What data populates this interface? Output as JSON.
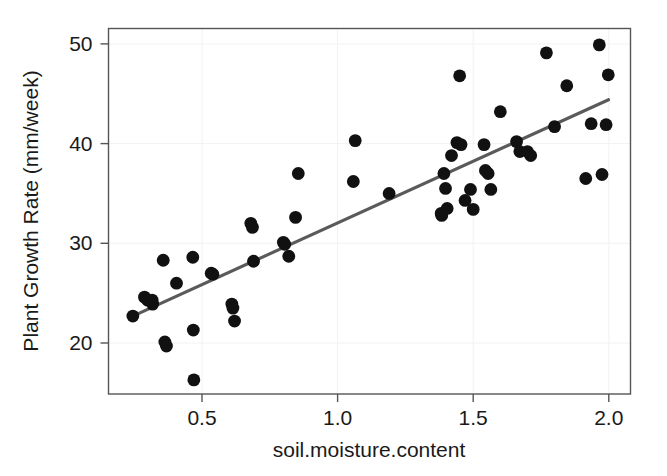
{
  "chart_data": {
    "type": "scatter",
    "title": "",
    "xlabel": "soil.moisture.content",
    "ylabel": "Plant Growth Rate (mm/week)",
    "xlim": [
      0.21,
      2.08
    ],
    "ylim": [
      15.0,
      51.3
    ],
    "xticks": [
      0.5,
      1.0,
      1.5,
      2.0
    ],
    "xtick_labels": [
      "0.5",
      "1.0",
      "1.5",
      "2.0"
    ],
    "yticks": [
      20,
      30,
      40,
      50
    ],
    "ytick_labels": [
      "20",
      "30",
      "40",
      "50"
    ],
    "grid": true,
    "grid_color": "#f2f2f2",
    "legend": null,
    "point_color": "#111111",
    "point_size": 6.4,
    "fitline": {
      "name": "linear regression fit",
      "color": "#5a5a5a",
      "width": 3.1,
      "x": [
        0.245,
        1.999
      ],
      "y": [
        22.7,
        44.4
      ]
    },
    "x": [
      0.245,
      0.288,
      0.3,
      0.316,
      0.318,
      0.357,
      0.363,
      0.369,
      0.406,
      0.466,
      0.468,
      0.47,
      0.534,
      0.54,
      0.61,
      0.614,
      0.62,
      0.68,
      0.686,
      0.69,
      0.8,
      0.805,
      0.82,
      0.845,
      0.855,
      1.058,
      1.065,
      1.19,
      1.382,
      1.384,
      1.392,
      1.398,
      1.404,
      1.42,
      1.44,
      1.45,
      1.455,
      1.47,
      1.49,
      1.5,
      1.54,
      1.545,
      1.555,
      1.565,
      1.6,
      1.66,
      1.672,
      1.7,
      1.712,
      1.77,
      1.8,
      1.845,
      1.915,
      1.935,
      1.965,
      1.975,
      1.99,
      1.998
    ],
    "y": [
      22.7,
      24.6,
      24.3,
      24.3,
      23.9,
      28.3,
      20.1,
      19.7,
      26.0,
      28.6,
      21.3,
      16.3,
      27.0,
      26.9,
      23.9,
      23.5,
      22.2,
      32.0,
      31.6,
      28.2,
      30.1,
      29.9,
      28.7,
      32.6,
      37.0,
      36.2,
      40.3,
      35.0,
      33.0,
      32.8,
      37.0,
      35.5,
      33.5,
      38.8,
      40.1,
      46.8,
      39.9,
      34.3,
      35.4,
      33.4,
      39.9,
      37.3,
      37.0,
      35.4,
      43.2,
      40.2,
      39.2,
      39.2,
      38.8,
      49.1,
      41.7,
      45.8,
      36.5,
      42.0,
      49.9,
      36.9,
      41.9,
      46.9
    ]
  },
  "axis": {
    "x_title": "soil.moisture.content",
    "y_title": "Plant Growth Rate (mm/week)"
  }
}
